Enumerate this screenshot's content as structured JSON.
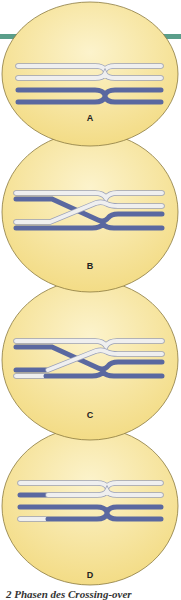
{
  "figure": {
    "caption": "2 Phasen des Crossing-over",
    "colors": {
      "accent_bar": "#5a9e8a",
      "cell_fill": "#f7e49a",
      "cell_fill_center": "#fbf0c4",
      "cell_border": "#8a7a40",
      "chromatid_light": "#eeeeee",
      "chromatid_dark": "#5a68a0",
      "chromatid_outline": "#9aa0b8"
    },
    "panels": [
      {
        "label": "A",
        "description": "Homologous chromosomes paired, no crossing"
      },
      {
        "label": "B",
        "description": "Non-sister chromatids cross over"
      },
      {
        "label": "C",
        "description": "Chromatid segments broken and exchanged"
      },
      {
        "label": "D",
        "description": "Recombined chromatids after crossing-over"
      }
    ]
  }
}
